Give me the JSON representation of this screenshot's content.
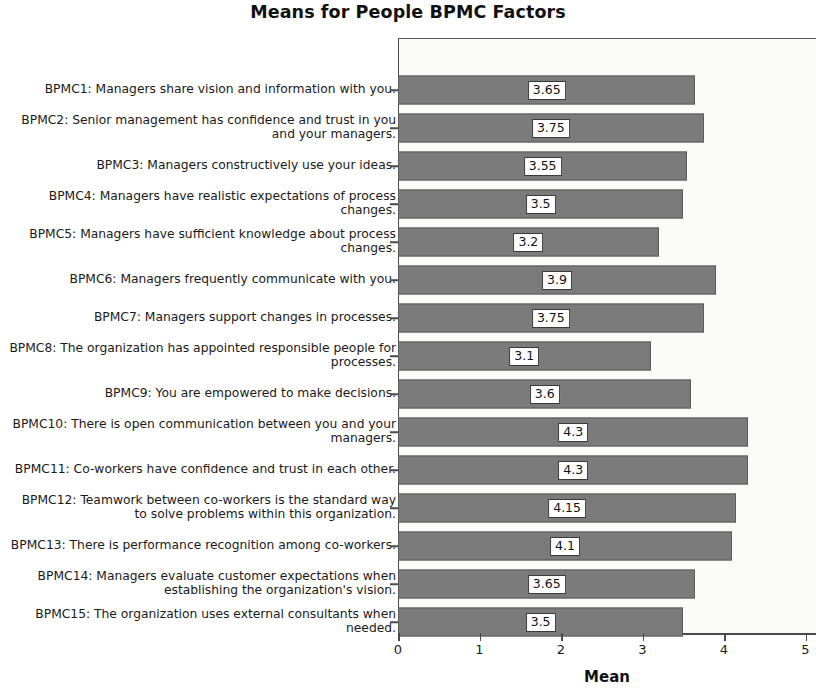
{
  "chart_data": {
    "type": "bar",
    "orientation": "horizontal",
    "title": "Means for People BPMC Factors",
    "xlabel": "Mean",
    "ylabel": "",
    "xlim": [
      0,
      5
    ],
    "xticks": [
      0,
      1,
      2,
      3,
      4,
      5
    ],
    "xtick_labels": [
      "0",
      "1",
      "2",
      "3",
      "4",
      "5"
    ],
    "grid": false,
    "legend": null,
    "bar_color": "#7b7b7b",
    "bar_edge_color": "#5c5c5c",
    "categories": [
      "BPMC1: Managers share vision and information with you.",
      "BPMC2: Senior management has confidence and trust in you and your managers.",
      "BPMC3: Managers constructively use your ideas.",
      "BPMC4: Managers have realistic expectations of process changes.",
      "BPMC5: Managers have sufficient knowledge about process changes.",
      "BPMC6: Managers frequently communicate with you.",
      "BPMC7: Managers support changes in processes.",
      "BPMC8: The organization has appointed responsible people for processes.",
      "BPMC9: You are empowered to make decisions.",
      "BPMC10: There is open communication between you and your managers.",
      "BPMC11: Co-workers have confidence and trust in each other.",
      "BPMC12: Teamwork between co-workers is the standard way to solve problems within this organization.",
      "BPMC13: There is performance recognition among co-workers.",
      "BPMC14: Managers evaluate customer expectations when establishing the organization's vision.",
      "BPMC15: The organization uses external consultants when needed."
    ],
    "values": [
      3.65,
      3.75,
      3.55,
      3.5,
      3.2,
      3.9,
      3.75,
      3.1,
      3.6,
      4.3,
      4.3,
      4.15,
      4.1,
      3.65,
      3.5
    ],
    "value_labels": [
      "3.65",
      "3.75",
      "3.55",
      "3.5",
      "3.2",
      "3.9",
      "3.75",
      "3.1",
      "3.6",
      "4.3",
      "4.3",
      "4.15",
      "4.1",
      "3.65",
      "3.5"
    ]
  }
}
